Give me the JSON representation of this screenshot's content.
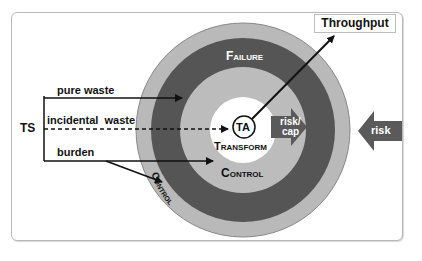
{
  "diagram": {
    "center_label": "TA",
    "center_sublabel": "Transform",
    "inner_ring_label": "Control",
    "middle_ring_label": "Failure",
    "outer_ring_label": "Control",
    "output_label": "Throughput",
    "source_label": "TS",
    "inputs": [
      {
        "label": "pure waste",
        "style": "solid"
      },
      {
        "label": "incidental  waste",
        "style": "dashed"
      },
      {
        "label": "burden",
        "style": "solid"
      }
    ],
    "inner_arrow_label_line1": "risk/",
    "inner_arrow_label_line2": "cap",
    "outer_arrow_label": "risk"
  },
  "colors": {
    "outer_ring": "#b9b9b9",
    "failure_ring": "#555555",
    "inner_ring": "#bcbcbc",
    "center": "#ffffff",
    "arrow_fill": "#5a5a5a",
    "line": "#111111"
  }
}
